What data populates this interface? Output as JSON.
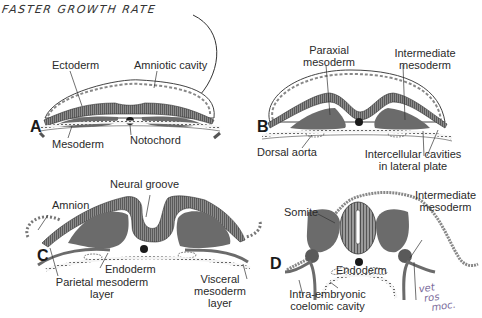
{
  "annotation": {
    "handwritten_title": "FASTER GROWTH RATE",
    "handwritten_note_lines": [
      "vet",
      "ros",
      "moc."
    ]
  },
  "panels": [
    {
      "letter": "A",
      "labels": {
        "ectoderm": "Ectoderm",
        "amniotic_cavity": "Amniotic cavity",
        "mesoderm": "Mesoderm",
        "notochord": "Notochord"
      }
    },
    {
      "letter": "B",
      "labels": {
        "paraxial_1": "Paraxial",
        "paraxial_2": "mesoderm",
        "intermediate_1": "Intermediate",
        "intermediate_2": "mesoderm",
        "dorsal_aorta": "Dorsal aorta",
        "cavities_1": "Intercellular cavities",
        "cavities_2": "in lateral plate"
      }
    },
    {
      "letter": "C",
      "labels": {
        "neural_groove": "Neural groove",
        "amnion": "Amnion",
        "endoderm": "Endoderm",
        "parietal_1": "Parietal mesoderm",
        "parietal_2": "layer",
        "visceral_1": "Visceral",
        "visceral_2": "mesoderm",
        "visceral_3": "layer"
      }
    },
    {
      "letter": "D",
      "labels": {
        "somite": "Somite",
        "intermediate_1": "Intermediate",
        "intermediate_2": "mesoderm",
        "endoderm": "Endoderm",
        "coelom_1": "Intra-embryonic",
        "coelom_2": "coelomic cavity"
      }
    }
  ],
  "colors": {
    "tissue_dark": "#6b6b6b",
    "tissue_mid": "#8a8a8a",
    "outline": "#333333",
    "background": "#ffffff"
  }
}
